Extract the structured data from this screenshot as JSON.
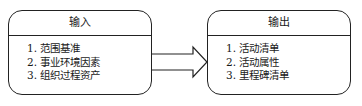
{
  "diagram": {
    "input_box": {
      "title": "输入",
      "items": [
        "1. 范围基准",
        "2. 事业环境因素",
        "3. 组织过程资产"
      ]
    },
    "output_box": {
      "title": "输出",
      "items": [
        "1. 活动清单",
        "2. 活动属性",
        "3. 里程碑清单"
      ]
    },
    "connector": {
      "type": "hollow-block-arrow",
      "direction": "left-to-right"
    },
    "colors": {
      "stroke": "#222222",
      "background": "#ffffff"
    }
  }
}
